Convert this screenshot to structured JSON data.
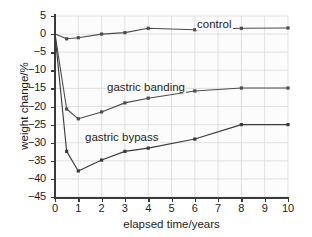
{
  "chart_data": {
    "type": "line",
    "title": "",
    "xlabel": "elapsed time/years",
    "ylabel": "weight change/%",
    "xlim": [
      0,
      10
    ],
    "ylim": [
      -45,
      5
    ],
    "xticks": [
      0,
      1,
      2,
      3,
      4,
      5,
      6,
      7,
      8,
      9,
      10
    ],
    "yticks": [
      5,
      0,
      -5,
      -10,
      -15,
      -20,
      -25,
      -30,
      -35,
      -40,
      -45
    ],
    "xtick_labels": [
      "0",
      "1",
      "2",
      "3",
      "4",
      "5",
      "6",
      "7",
      "8",
      "9",
      "10"
    ],
    "ytick_labels": [
      "5",
      "0",
      "−5",
      "−10",
      "−15",
      "−20",
      "−25",
      "−30",
      "−35",
      "−40",
      "−45"
    ],
    "grid": true,
    "grid_color": "#d9d9d9",
    "legend_position": "inline-labels",
    "x": [
      0,
      0.5,
      1,
      2,
      3,
      4,
      6,
      8,
      10
    ],
    "series": [
      {
        "name": "control",
        "label": "control",
        "color": "#4d4d4d",
        "marker": "square",
        "values": [
          0.0,
          -1.3,
          -1.0,
          0.0,
          0.4,
          1.6,
          1.2,
          1.6,
          1.7
        ]
      },
      {
        "name": "gastric banding",
        "label": "gastric banding",
        "color": "#4d4d4d",
        "marker": "square",
        "values": [
          0.0,
          -20.7,
          -23.4,
          -21.5,
          -19.0,
          -17.7,
          -15.7,
          -14.9,
          -14.9
        ]
      },
      {
        "name": "gastric bypass",
        "label": "gastric bypass",
        "color": "#3a3a3a",
        "marker": "square",
        "values": [
          0.0,
          -32.4,
          -37.8,
          -34.8,
          -32.4,
          -31.5,
          -29.0,
          -25.0,
          -25.0
        ]
      }
    ],
    "annotations": [
      {
        "text": "control",
        "x": 5.2,
        "y": 3.1
      },
      {
        "text": "gastric banding",
        "x": 2.2,
        "y": -13.6
      },
      {
        "text": "gastric bypass",
        "x": 1.3,
        "y": -27.5
      }
    ]
  },
  "axes": {
    "x_title": "elapsed time/years",
    "y_title": "weight change/%"
  }
}
